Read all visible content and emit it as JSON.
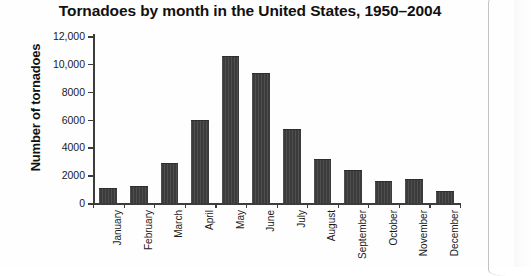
{
  "chart_data": {
    "type": "bar",
    "title": "Tornadoes by month in the United States, 1950–2004",
    "xlabel": "",
    "ylabel": "Number of tornadoes",
    "categories": [
      "January",
      "February",
      "March",
      "April",
      "May",
      "June",
      "July",
      "August",
      "September",
      "October",
      "November",
      "December"
    ],
    "values": [
      1000,
      1150,
      2800,
      5900,
      10500,
      9300,
      5250,
      3100,
      2300,
      1500,
      1650,
      800
    ],
    "ylim": [
      0,
      12000
    ],
    "yticks": [
      0,
      2000,
      4000,
      6000,
      8000,
      10000,
      12000
    ],
    "ytick_labels": [
      "0",
      "2000",
      "4000",
      "6000",
      "8000",
      "10,000",
      "12,000"
    ],
    "grid": false,
    "legend": null,
    "bar_color": "#3b3b3b",
    "axis_color": "#3c3c3c"
  }
}
